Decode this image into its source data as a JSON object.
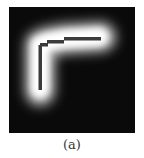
{
  "figure": {
    "caption": "(a)",
    "panel": {
      "background_color": "#0a0a0a",
      "glow_color": "#ffffff",
      "skeleton_color": "#3a3a3a",
      "description": "Blurred L-shaped bright band with thin dark skeleton polyline"
    }
  }
}
